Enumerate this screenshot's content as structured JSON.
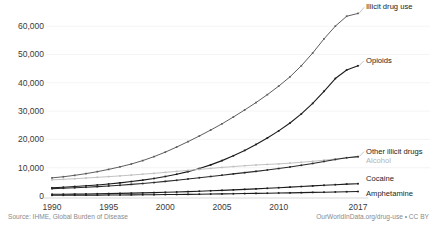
{
  "chart_data": {
    "type": "line",
    "title": "",
    "subtitle": "",
    "xlabel": "",
    "ylabel": "",
    "xlim": [
      1990,
      2017
    ],
    "ylim": [
      0,
      65000
    ],
    "grid": true,
    "legend_position": "right-inline-labels",
    "x": [
      1990,
      1991,
      1992,
      1993,
      1994,
      1995,
      1996,
      1997,
      1998,
      1999,
      2000,
      2001,
      2002,
      2003,
      2004,
      2005,
      2006,
      2007,
      2008,
      2009,
      2010,
      2011,
      2012,
      2013,
      2014,
      2015,
      2016,
      2017
    ],
    "y_ticks": [
      0,
      10000,
      20000,
      30000,
      40000,
      50000,
      60000
    ],
    "y_tick_labels": [
      "0",
      "10,000",
      "20,000",
      "30,000",
      "40,000",
      "50,000",
      "60,000"
    ],
    "x_ticks": [
      1990,
      1995,
      2000,
      2005,
      2010,
      2017
    ],
    "x_tick_labels": [
      "1990",
      "1995",
      "2000",
      "2005",
      "2010",
      "2017"
    ],
    "series": [
      {
        "name": "Illicit drug use",
        "label": "Illicit drug use",
        "color": "#5e5e5e",
        "label_color": "#1c1c1c",
        "values": [
          6400,
          6800,
          7300,
          7900,
          8600,
          9400,
          10300,
          11300,
          12500,
          13900,
          15500,
          17300,
          19200,
          21200,
          23300,
          25500,
          27900,
          30400,
          33000,
          35800,
          38800,
          42100,
          46000,
          50500,
          55500,
          60000,
          63500,
          64500
        ]
      },
      {
        "name": "Opioids",
        "label": "Opioids",
        "color": "#1c1c1c",
        "label_color": "#1c1c1c",
        "values": [
          2900,
          3100,
          3350,
          3600,
          3900,
          4250,
          4650,
          5100,
          5600,
          6200,
          6900,
          7700,
          8600,
          9700,
          11000,
          12500,
          14200,
          16100,
          18200,
          20500,
          23000,
          25800,
          29000,
          32700,
          37000,
          41500,
          44500,
          46000
        ]
      },
      {
        "name": "Alcohol",
        "label": "Alcohol",
        "color": "#c2c2c2",
        "label_color": "#b3b3b3",
        "values": [
          5700,
          5900,
          6100,
          6350,
          6600,
          6850,
          7100,
          7400,
          7700,
          8000,
          8350,
          8700,
          9050,
          9400,
          9750,
          10100,
          10400,
          10700,
          10950,
          11150,
          11350,
          11600,
          11900,
          12250,
          12650,
          13100,
          13500,
          13800
        ]
      },
      {
        "name": "Other illicit drugs",
        "label": "Other illicit drugs",
        "color": "#2a2a2a",
        "label_color": "#1c1c1c",
        "values": [
          2600,
          2750,
          2900,
          3100,
          3300,
          3550,
          3800,
          4100,
          4400,
          4750,
          5150,
          5550,
          6000,
          6450,
          6900,
          7350,
          7800,
          8250,
          8700,
          9200,
          9700,
          10250,
          10850,
          11500,
          12200,
          12900,
          13500,
          13900
        ]
      },
      {
        "name": "Cocaine",
        "label": "Cocaine",
        "color": "#1c1c1c",
        "label_color": "#1c1c1c",
        "values": [
          600,
          640,
          680,
          730,
          790,
          850,
          920,
          1000,
          1090,
          1190,
          1300,
          1420,
          1550,
          1690,
          1840,
          2000,
          2170,
          2350,
          2530,
          2720,
          2920,
          3130,
          3350,
          3570,
          3790,
          4000,
          4200,
          4350
        ]
      },
      {
        "name": "Amphetamine",
        "label": "Amphetamine",
        "color": "#1c1c1c",
        "label_color": "#1c1c1c",
        "values": [
          250,
          265,
          280,
          300,
          320,
          345,
          370,
          400,
          430,
          465,
          505,
          545,
          590,
          640,
          690,
          745,
          800,
          860,
          920,
          985,
          1050,
          1120,
          1190,
          1270,
          1350,
          1430,
          1510,
          1580
        ]
      }
    ]
  },
  "footer": {
    "source": "Source: IHME, Global Burden of Disease",
    "attribution": "OurWorldInData.org/drug-use • CC BY"
  },
  "labels": {
    "illicit_drug_use": "Illicit drug use",
    "opioids": "Opioids",
    "other_illicit_drugs": "Other illicit drugs",
    "alcohol": "Alcohol",
    "cocaine": "Cocaine",
    "amphetamine": "Amphetamine"
  },
  "colors": {
    "grid": "#efefef",
    "axis": "#cfcfcf",
    "text": "#3a3a3a",
    "muted_text": "#b3b3b3",
    "footer_text": "#8a8a8a",
    "background": "#ffffff"
  }
}
